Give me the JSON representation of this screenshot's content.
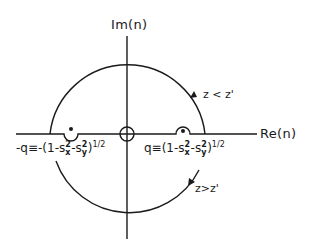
{
  "figure": {
    "axes": {
      "imag_label": "Im(n)",
      "real_label": "Re(n)"
    },
    "poles": {
      "neg": {
        "lhs": "-q≡-(1-s",
        "sx_sup": "2",
        "sx_sub": "x",
        "mid": "-s",
        "sy_sup": "2",
        "sy_sub": "y",
        "rhs": ")",
        "power": "1/2"
      },
      "pos": {
        "lhs": "q≡(1-s",
        "sx_sup": "2",
        "sx_sub": "x",
        "mid": "-s",
        "sy_sup": "2",
        "sy_sub": "y",
        "rhs": ")",
        "power": "1/2"
      }
    },
    "contours": {
      "upper_label": "z < z'",
      "lower_label": "z>z'"
    },
    "colors": {
      "ink": "#1a1a1a",
      "background": "#ffffff"
    }
  }
}
